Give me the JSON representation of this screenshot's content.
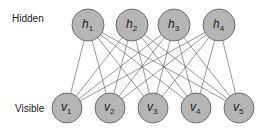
{
  "diagram": {
    "type": "bipartite-network",
    "layers": {
      "hidden": {
        "label": "Hidden",
        "nodes": [
          {
            "id": "h1",
            "base": "h",
            "sub": "1",
            "x": 88,
            "y": 25
          },
          {
            "id": "h2",
            "base": "h",
            "sub": "2",
            "x": 132,
            "y": 25
          },
          {
            "id": "h3",
            "base": "h",
            "sub": "3",
            "x": 174,
            "y": 25
          },
          {
            "id": "h4",
            "base": "h",
            "sub": "4",
            "x": 219,
            "y": 25
          }
        ]
      },
      "visible": {
        "label": "Visible",
        "nodes": [
          {
            "id": "v1",
            "base": "v",
            "sub": "1",
            "x": 67,
            "y": 108
          },
          {
            "id": "v2",
            "base": "v",
            "sub": "2",
            "x": 110,
            "y": 108
          },
          {
            "id": "v3",
            "base": "v",
            "sub": "3",
            "x": 153,
            "y": 108
          },
          {
            "id": "v4",
            "base": "v",
            "sub": "4",
            "x": 196,
            "y": 108
          },
          {
            "id": "v5",
            "base": "v",
            "sub": "5",
            "x": 239,
            "y": 108
          }
        ]
      }
    },
    "edges": "fully-connected hidden-to-visible",
    "colors": {
      "node_fill": "#b5b5b5",
      "node_stroke": "#6e6e6e",
      "edge": "#555555",
      "text": "#222222"
    }
  }
}
